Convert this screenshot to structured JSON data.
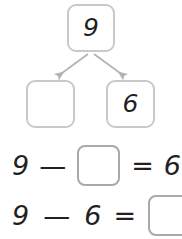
{
  "worksheet": {
    "type": "number-bond-subtraction",
    "colors": {
      "box_border": "#c9c9c9",
      "blank_border": "#a9a9a9",
      "arrow": "#b3b3b3",
      "text": "#231f20",
      "background": "#ffffff"
    }
  },
  "number_bond": {
    "whole": {
      "label": "9",
      "filled": true
    },
    "parts": [
      {
        "label": "",
        "filled": false
      },
      {
        "label": "6",
        "filled": true
      }
    ],
    "arrows": [
      {
        "name": "arrow-to-left-part",
        "direction": "down-left"
      },
      {
        "name": "arrow-to-right-part",
        "direction": "down-right"
      }
    ]
  },
  "equations": [
    {
      "name": "equation-one",
      "tokens": [
        {
          "kind": "number",
          "text": "9"
        },
        {
          "kind": "operator",
          "text": "—"
        },
        {
          "kind": "blank",
          "text": ""
        },
        {
          "kind": "operator",
          "text": "="
        },
        {
          "kind": "number",
          "text": "6"
        }
      ]
    },
    {
      "name": "equation-two",
      "tokens": [
        {
          "kind": "number",
          "text": "9"
        },
        {
          "kind": "operator",
          "text": "—"
        },
        {
          "kind": "number",
          "text": "6"
        },
        {
          "kind": "operator",
          "text": "="
        },
        {
          "kind": "blank",
          "text": ""
        }
      ]
    }
  ]
}
